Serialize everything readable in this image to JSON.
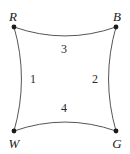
{
  "figure": {
    "type": "geometry-diagram",
    "background_color": "#ffffff",
    "stroke_color": "#555555",
    "vertex_dot_color": "#1a1a1a",
    "label_color": "#1a1a1a",
    "vertices": [
      {
        "id": "R",
        "label": "R",
        "x": 14,
        "y": 27,
        "label_x": 13,
        "label_y": 16
      },
      {
        "id": "B",
        "label": "B",
        "x": 116,
        "y": 27,
        "label_x": 117,
        "label_y": 16
      },
      {
        "id": "W",
        "label": "W",
        "x": 14,
        "y": 131,
        "label_x": 14,
        "label_y": 143
      },
      {
        "id": "G",
        "label": "G",
        "x": 116,
        "y": 131,
        "label_x": 117,
        "label_y": 143
      }
    ],
    "edges": [
      {
        "id": "left",
        "label": "1",
        "from": "R",
        "to": "W",
        "bow": "inward-right",
        "label_x": 33,
        "label_y": 79
      },
      {
        "id": "right",
        "label": "2",
        "from": "B",
        "to": "G",
        "bow": "inward-left",
        "label_x": 95,
        "label_y": 79
      },
      {
        "id": "top",
        "label": "3",
        "from": "R",
        "to": "B",
        "bow": "inward-down",
        "label_x": 64,
        "label_y": 49
      },
      {
        "id": "bottom",
        "label": "4",
        "from": "W",
        "to": "G",
        "bow": "inward-up",
        "label_x": 64,
        "label_y": 108
      }
    ],
    "paths": {
      "top": "M 14 27 Q 65 45 116 27",
      "right": "M 116 27 Q 101 79 116 131",
      "bottom": "M 116 131 Q 65 113 14 131",
      "left": "M 14 131 Q 29 79 14 27"
    }
  }
}
